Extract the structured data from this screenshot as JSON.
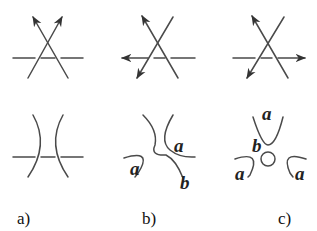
{
  "figure": {
    "panels": [
      {
        "id": "a",
        "caption": "a)",
        "top": "crossing of two oriented strands over a horizontal line, both arrows pointing up",
        "bottom_labels": []
      },
      {
        "id": "b",
        "caption": "b)",
        "top": "crossing with one arrow up-left, one down-left, horizontal arrow pointing left",
        "bottom_labels": [
          "a",
          "a",
          "b"
        ]
      },
      {
        "id": "c",
        "caption": "c)",
        "top": "crossing with one arrow up-left, one down-left, horizontal arrow pointing right",
        "bottom_labels": [
          "a",
          "b",
          "a",
          "a"
        ]
      }
    ],
    "labels": {
      "b_left_a": "a",
      "b_right_a": "a",
      "b_b": "b",
      "c_top_a": "a",
      "c_b": "b",
      "c_left_a": "a",
      "c_right_a": "a"
    },
    "captions": {
      "a": "a)",
      "b": "b)",
      "c": "c)"
    },
    "colors": {
      "stroke": "#4a4a4a",
      "text": "#222222"
    }
  }
}
